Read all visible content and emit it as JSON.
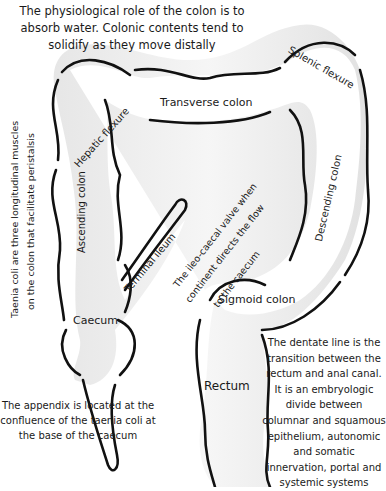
{
  "notes": {
    "physiology": "The physiological role of the colon is to absorb water. Colonic contents tend to solidify as they move distally",
    "taenia_coli_line1": "Taenia coli are three longitudinal muscles",
    "taenia_coli_line2": "on the colon that facilitate peristalsis",
    "ileocaecal_line1": "The ileo-caecal valve when",
    "ileocaecal_line2": "continent directs the flow",
    "ileocaecal_line3": "to the caecum",
    "appendix": "The appendix is located at the confluence of the taenia coli at the base of the caecum",
    "dentate_line": "The dentate line is the transition between the rectum and anal canal. It is an embryologic divide between columnar and squamous epithelium, autonomic and somatic innervation, portal and systemic systems"
  },
  "labels": {
    "hepatic_flexure": "Hepatic flexure",
    "transverse_colon": "Transverse colon",
    "splenic_flexure": "Splenic flexure",
    "ascending_colon": "Ascending colon",
    "descending_colon": "Descending colon",
    "terminal_ileum": "Terminal ileum",
    "caecum": "Caecum",
    "sigmoid_colon": "Sigmoid colon",
    "rectum": "Rectum"
  }
}
